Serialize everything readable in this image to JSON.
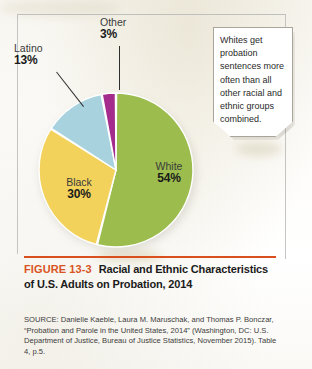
{
  "figure": {
    "number_label": "FIGURE 13-3",
    "title": "Racial and Ethnic Characteristics of U.S. Adults on Probation, 2014",
    "accent_color": "#d9541f",
    "source": "SOURCE: Danielle Kaeble, Laura M. Maruschak, and Thomas P. Bonczar, “Probation and Parole in the United States, 2014” (Washington, DC: U.S. Department of Justice, Bureau of Justice Statistics, November 2015). Table 4, p.5."
  },
  "callout": {
    "text": "Whites get probation sentences more often than all other racial and ethnic groups combined."
  },
  "labels": {
    "white": {
      "name": "White",
      "pct": "54%"
    },
    "black": {
      "name": "Black",
      "pct": "30%"
    },
    "latino": {
      "name": "Latino",
      "pct": "13%"
    },
    "other": {
      "name": "Other",
      "pct": "3%"
    }
  },
  "chart_data": {
    "type": "pie",
    "title": "Racial and Ethnic Characteristics of U.S. Adults on Probation, 2014",
    "categories": [
      "White",
      "Black",
      "Latino",
      "Other"
    ],
    "values": [
      54,
      30,
      13,
      3
    ],
    "value_unit": "percent",
    "data_labels": [
      "54%",
      "30%",
      "13%",
      "3%"
    ],
    "colors": [
      "#9CBD4E",
      "#F3D25C",
      "#A7D2DE",
      "#A32C8C"
    ],
    "start_angle_deg": 0,
    "direction": "clockwise",
    "slice_gap": true,
    "legend": "none",
    "labels_position": "inside-and-leader-lines",
    "xlabel": "",
    "ylabel": ""
  }
}
